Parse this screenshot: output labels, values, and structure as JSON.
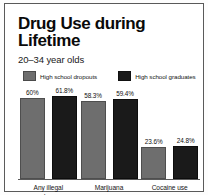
{
  "figure": {
    "title": "Drug Use during Lifetime",
    "subtitle": "20–34 year olds"
  },
  "legend": {
    "items": [
      {
        "label": "High school dropouts",
        "swatch": "gray-swatch-icon",
        "color": "#6e6e6e"
      },
      {
        "label": "High school graduates",
        "swatch": "black-swatch-icon",
        "color": "#1a1a1a"
      }
    ]
  },
  "chart_data": {
    "type": "bar",
    "title": "Drug Use during Lifetime",
    "subtitle": "20–34 year olds",
    "xlabel": "",
    "ylabel": "",
    "ylim": [
      0,
      70
    ],
    "grid": false,
    "legend_position": "top",
    "categories": [
      "Any illegal drug",
      "Marijuana use",
      "Cocaine use"
    ],
    "series": [
      {
        "name": "High school dropouts",
        "color": "#6e6e6e",
        "values": [
          60,
          58.3,
          23.6
        ],
        "labels": [
          "60%",
          "58.3%",
          "23.6%"
        ]
      },
      {
        "name": "High school graduates",
        "color": "#1a1a1a",
        "values": [
          61.8,
          59.4,
          24.8
        ],
        "labels": [
          "61.8%",
          "59.4%",
          "24.8%"
        ]
      }
    ]
  },
  "categories_display": [
    {
      "line1": "Any illegal",
      "line2": "drug"
    },
    {
      "line1": "Marijuana",
      "line2": "use"
    },
    {
      "line1": "Cocaine use",
      "line2": ""
    }
  ]
}
